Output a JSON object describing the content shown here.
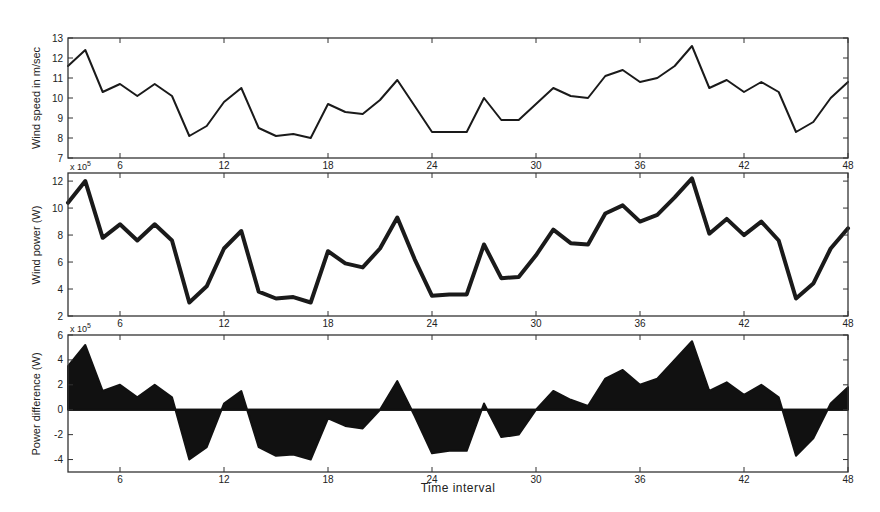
{
  "chart_data": [
    {
      "type": "line",
      "title": "",
      "xlabel": "",
      "ylabel": "Wind speed in m/sec",
      "xlim": [
        3,
        48
      ],
      "ylim": [
        7,
        13
      ],
      "xticks": [
        6,
        12,
        18,
        24,
        30,
        36,
        42,
        48
      ],
      "yticks": [
        7,
        8,
        9,
        10,
        11,
        12,
        13
      ],
      "grid": false,
      "line_width": 2,
      "color": "#1a1a1a",
      "x": [
        3,
        4,
        5,
        6,
        7,
        8,
        9,
        10,
        11,
        12,
        13,
        14,
        15,
        16,
        17,
        18,
        19,
        20,
        21,
        22,
        23,
        24,
        25,
        26,
        27,
        28,
        29,
        30,
        31,
        32,
        33,
        34,
        35,
        36,
        37,
        38,
        39,
        40,
        41,
        42,
        43,
        44,
        45,
        46,
        47,
        48
      ],
      "series": [
        {
          "name": "Wind speed",
          "values": [
            11.6,
            12.4,
            10.3,
            10.7,
            10.1,
            10.7,
            10.1,
            8.1,
            8.6,
            9.8,
            10.5,
            8.5,
            8.1,
            8.2,
            8.0,
            9.7,
            9.3,
            9.2,
            9.9,
            10.9,
            9.6,
            8.3,
            8.3,
            8.3,
            10.0,
            8.9,
            8.9,
            9.7,
            10.5,
            10.1,
            10.0,
            11.1,
            11.4,
            10.8,
            11.0,
            11.6,
            12.6,
            10.5,
            10.9,
            10.3,
            10.8,
            10.3,
            8.3,
            8.8,
            10.0,
            10.8
          ]
        }
      ]
    },
    {
      "type": "line",
      "title": "",
      "xlabel": "",
      "ylabel": "Wind power (W)",
      "y_multiplier": "x 10^5",
      "xlim": [
        3,
        48
      ],
      "ylim": [
        2,
        12.6
      ],
      "xticks": [
        6,
        12,
        18,
        24,
        30,
        36,
        42,
        48
      ],
      "yticks": [
        2,
        4,
        6,
        8,
        10,
        12
      ],
      "grid": false,
      "line_width": 4,
      "color": "#1a1a1a",
      "x": [
        3,
        4,
        5,
        6,
        7,
        8,
        9,
        10,
        11,
        12,
        13,
        14,
        15,
        16,
        17,
        18,
        19,
        20,
        21,
        22,
        23,
        24,
        25,
        26,
        27,
        28,
        29,
        30,
        31,
        32,
        33,
        34,
        35,
        36,
        37,
        38,
        39,
        40,
        41,
        42,
        43,
        44,
        45,
        46,
        47,
        48
      ],
      "series": [
        {
          "name": "Wind power",
          "values": [
            10.4,
            12.0,
            7.8,
            8.8,
            7.6,
            8.8,
            7.6,
            3.0,
            4.2,
            7.0,
            8.3,
            3.8,
            3.3,
            3.4,
            3.0,
            6.8,
            5.9,
            5.6,
            7.0,
            9.3,
            6.2,
            3.5,
            3.6,
            3.6,
            7.3,
            4.8,
            4.9,
            6.5,
            8.4,
            7.4,
            7.3,
            9.6,
            10.2,
            9.0,
            9.5,
            10.8,
            12.2,
            8.1,
            9.2,
            8.0,
            9.0,
            7.6,
            3.3,
            4.4,
            7.0,
            8.5
          ]
        }
      ]
    },
    {
      "type": "area",
      "title": "",
      "xlabel": "Time interval",
      "ylabel": "Power difference (W)",
      "y_multiplier": "x 10^5",
      "xlim": [
        3,
        48
      ],
      "ylim": [
        -5,
        6
      ],
      "xticks": [
        6,
        12,
        18,
        24,
        30,
        36,
        42,
        48
      ],
      "yticks": [
        -4,
        -2,
        0,
        2,
        4,
        6
      ],
      "grid": false,
      "baseline": 0,
      "color": "#111111",
      "x": [
        3,
        4,
        5,
        6,
        7,
        8,
        9,
        10,
        11,
        12,
        13,
        14,
        15,
        16,
        17,
        18,
        19,
        20,
        21,
        22,
        23,
        24,
        25,
        26,
        27,
        28,
        29,
        30,
        31,
        32,
        33,
        34,
        35,
        36,
        37,
        38,
        39,
        40,
        41,
        42,
        43,
        44,
        45,
        46,
        47,
        48
      ],
      "series": [
        {
          "name": "Power difference",
          "values": [
            3.5,
            5.2,
            1.5,
            2.0,
            1.0,
            2.0,
            1.0,
            -4.0,
            -3.0,
            0.5,
            1.5,
            -3.0,
            -3.7,
            -3.6,
            -4.0,
            -0.7,
            -1.3,
            -1.5,
            0.0,
            2.3,
            -0.5,
            -3.5,
            -3.3,
            -3.3,
            0.5,
            -2.2,
            -2.0,
            0.0,
            1.5,
            0.8,
            0.3,
            2.5,
            3.2,
            2.0,
            2.5,
            4.0,
            5.5,
            1.5,
            2.2,
            1.2,
            2.0,
            1.0,
            -3.7,
            -2.3,
            0.5,
            1.8
          ]
        }
      ]
    }
  ],
  "labels": {
    "panel1_ylabel": "Wind speed in m/sec",
    "panel2_ylabel": "Wind power (W)",
    "panel2_multiplier_base": "x 10",
    "panel2_multiplier_exp": "5",
    "panel3_ylabel": "Power difference (W)",
    "panel3_multiplier_base": "x 10",
    "panel3_multiplier_exp": "5",
    "xlabel": "Time interval"
  },
  "layout": {
    "plot_left": 68,
    "plot_right": 848,
    "panels": [
      {
        "top": 38,
        "bottom": 158
      },
      {
        "top": 173,
        "bottom": 316
      },
      {
        "top": 335,
        "bottom": 472
      }
    ]
  }
}
